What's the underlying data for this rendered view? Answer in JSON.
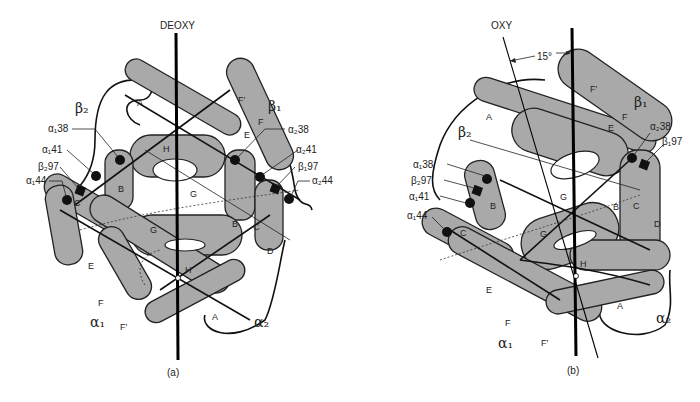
{
  "figure": {
    "panel_a": {
      "caption": "(a)",
      "axis_label": "DEOXY",
      "subunits": {
        "beta2": "β₂",
        "beta1": "β₁",
        "alpha1": "α₁",
        "alpha2": "α₂"
      },
      "residue_labels": {
        "a1_38": "α₁38",
        "a1_41": "α₁41",
        "b2_97": "β₂97",
        "a1_44": "α₁44",
        "a2_38": "α₂38",
        "a2_41": "α₂41",
        "b1_97": "β₁97",
        "a2_44": "α₂44"
      },
      "helix_labels": {
        "A_top": "A",
        "F_prime_top": "F′",
        "F_top": "F",
        "E_top": "E",
        "H_top": "H",
        "B_left": "B",
        "C_left": "C",
        "G_top": "G",
        "G_mid": "G",
        "B_right": "B",
        "C_right": "C",
        "D_right": "D",
        "E_left": "E",
        "H_bot": "H",
        "F_bot": "F",
        "F_prime_bot": "F′",
        "A_bot": "A"
      }
    },
    "panel_b": {
      "caption": "(b)",
      "axis_label": "OXY",
      "angle_label": "15°",
      "subunits": {
        "beta2": "β₂",
        "beta1": "β₁",
        "alpha1": "α₁",
        "alpha2": "α₂"
      },
      "residue_labels": {
        "a1_38": "α₁38",
        "b2_97": "β₂97",
        "a1_41": "α₁41",
        "a1_44": "α₁44",
        "a2_38": "α₂38",
        "b1_97": "β₁97"
      },
      "helix_labels": {
        "A_top": "A",
        "F_prime_top": "F′",
        "F_top": "F",
        "E_top": "E",
        "B_left": "B",
        "C_left": "C",
        "G_top": "G",
        "B_right": "B",
        "C_right": "C",
        "D_right": "D",
        "G_mid": "G",
        "H_bot": "H",
        "E_left": "E",
        "F_bot": "F",
        "F_prime_bot": "F′",
        "A_bot": "A"
      }
    }
  }
}
